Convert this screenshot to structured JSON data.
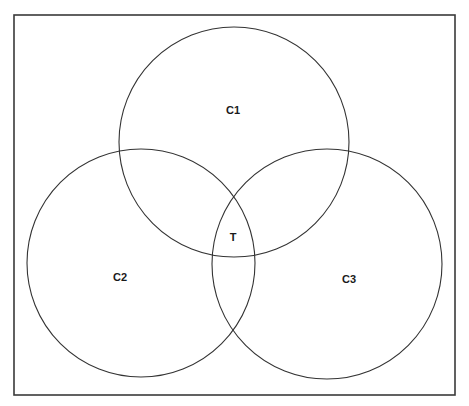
{
  "diagram": {
    "type": "venn",
    "frame": {
      "x": 14,
      "y": 15,
      "width": 441,
      "height": 380,
      "stroke": "#3a3a3a"
    },
    "circles": [
      {
        "id": "C1",
        "label": "C1",
        "cx": 234,
        "cy": 142,
        "r": 115,
        "label_x": 233,
        "label_y": 114
      },
      {
        "id": "C2",
        "label": "C2",
        "cx": 141,
        "cy": 263,
        "r": 114,
        "label_x": 120,
        "label_y": 281
      },
      {
        "id": "C3",
        "label": "C3",
        "cx": 327,
        "cy": 264,
        "r": 115,
        "label_x": 349,
        "label_y": 283
      }
    ],
    "intersection": {
      "label": "T",
      "x": 233,
      "y": 241
    },
    "stroke_color": "#333333"
  }
}
